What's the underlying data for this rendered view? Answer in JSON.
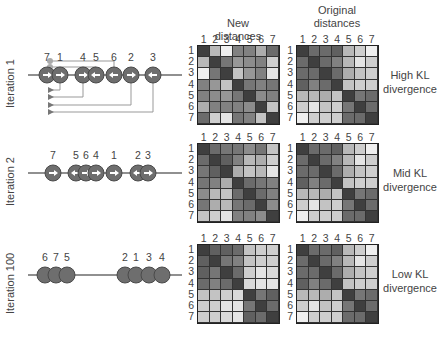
{
  "headers": {
    "new_distances": [
      "New",
      "distances"
    ],
    "original_distances": [
      "Original",
      "distances"
    ]
  },
  "axis_indices": [
    "1",
    "2",
    "3",
    "4",
    "5",
    "6",
    "7"
  ],
  "rows": [
    {
      "iteration_label": "Iteration 1",
      "kl_label": [
        "High KL",
        "divergence"
      ],
      "points": [
        {
          "label": "7",
          "x": 47,
          "dir": "right"
        },
        {
          "label": "1",
          "x": 60,
          "dir": "right"
        },
        {
          "label": "4",
          "x": 83,
          "dir": "right"
        },
        {
          "label": "5",
          "x": 96,
          "dir": "left"
        },
        {
          "label": "6",
          "x": 114,
          "dir": "left"
        },
        {
          "label": "2",
          "x": 131,
          "dir": "right"
        },
        {
          "label": "3",
          "x": 153,
          "dir": "left"
        }
      ],
      "new_matrix": [
        [
          15,
          70,
          95,
          45,
          45,
          65,
          35
        ],
        [
          70,
          15,
          40,
          55,
          50,
          45,
          80
        ],
        [
          95,
          40,
          15,
          75,
          55,
          45,
          90
        ],
        [
          45,
          55,
          75,
          15,
          40,
          45,
          40
        ],
        [
          45,
          50,
          55,
          40,
          15,
          50,
          45
        ],
        [
          65,
          45,
          45,
          45,
          50,
          15,
          75
        ],
        [
          35,
          80,
          90,
          40,
          45,
          75,
          15
        ]
      ],
      "original_matrix": [
        [
          15,
          35,
          35,
          30,
          70,
          80,
          95
        ],
        [
          35,
          15,
          35,
          45,
          70,
          90,
          80
        ],
        [
          35,
          35,
          15,
          35,
          65,
          75,
          80
        ],
        [
          30,
          45,
          35,
          15,
          75,
          80,
          80
        ],
        [
          70,
          70,
          65,
          75,
          15,
          40,
          35
        ],
        [
          80,
          90,
          75,
          80,
          40,
          15,
          35
        ],
        [
          95,
          80,
          80,
          80,
          35,
          35,
          15
        ]
      ]
    },
    {
      "iteration_label": "Iteration 2",
      "kl_label": [
        "Mid KL",
        "divergence"
      ],
      "points": [
        {
          "label": "7",
          "x": 53,
          "dir": "right"
        },
        {
          "label": "5",
          "x": 76,
          "dir": "left"
        },
        {
          "label": "6",
          "x": 86,
          "dir": "right"
        },
        {
          "label": "4",
          "x": 96,
          "dir": "right"
        },
        {
          "label": "1",
          "x": 114,
          "dir": "right"
        },
        {
          "label": "2",
          "x": 138,
          "dir": "left"
        },
        {
          "label": "3",
          "x": 148,
          "dir": "right"
        }
      ],
      "new_matrix": [
        [
          15,
          35,
          40,
          40,
          50,
          40,
          75
        ],
        [
          35,
          15,
          30,
          45,
          70,
          65,
          80
        ],
        [
          40,
          30,
          15,
          65,
          75,
          70,
          90
        ],
        [
          40,
          45,
          65,
          15,
          35,
          40,
          45
        ],
        [
          50,
          70,
          75,
          35,
          15,
          35,
          45
        ],
        [
          40,
          65,
          70,
          40,
          35,
          15,
          50
        ],
        [
          75,
          80,
          90,
          45,
          45,
          50,
          15
        ]
      ],
      "original_matrix": [
        [
          15,
          35,
          35,
          30,
          70,
          80,
          95
        ],
        [
          35,
          15,
          35,
          45,
          70,
          90,
          80
        ],
        [
          35,
          35,
          15,
          35,
          65,
          75,
          80
        ],
        [
          30,
          45,
          35,
          15,
          75,
          80,
          80
        ],
        [
          70,
          70,
          65,
          75,
          15,
          40,
          35
        ],
        [
          80,
          90,
          75,
          80,
          40,
          15,
          35
        ],
        [
          95,
          80,
          80,
          80,
          35,
          35,
          15
        ]
      ]
    },
    {
      "iteration_label": "Iteration 100",
      "kl_label": [
        "Low KL",
        "divergence"
      ],
      "points": [
        {
          "label": "6",
          "x": 45,
          "dir": "none"
        },
        {
          "label": "7",
          "x": 56,
          "dir": "none"
        },
        {
          "label": "5",
          "x": 67,
          "dir": "none"
        },
        {
          "label": "2",
          "x": 125,
          "dir": "none"
        },
        {
          "label": "1",
          "x": 136,
          "dir": "none"
        },
        {
          "label": "3",
          "x": 149,
          "dir": "none"
        },
        {
          "label": "4",
          "x": 162,
          "dir": "none"
        }
      ],
      "new_matrix": [
        [
          15,
          30,
          30,
          35,
          75,
          80,
          80
        ],
        [
          30,
          15,
          40,
          45,
          75,
          80,
          80
        ],
        [
          30,
          40,
          15,
          35,
          80,
          90,
          85
        ],
        [
          35,
          45,
          35,
          15,
          85,
          90,
          90
        ],
        [
          75,
          75,
          80,
          85,
          15,
          40,
          30
        ],
        [
          80,
          80,
          90,
          90,
          40,
          15,
          35
        ],
        [
          80,
          80,
          85,
          90,
          30,
          35,
          15
        ]
      ],
      "original_matrix": [
        [
          15,
          35,
          35,
          30,
          70,
          80,
          95
        ],
        [
          35,
          15,
          35,
          45,
          70,
          90,
          80
        ],
        [
          35,
          35,
          15,
          35,
          65,
          75,
          80
        ],
        [
          30,
          45,
          35,
          15,
          75,
          80,
          80
        ],
        [
          70,
          70,
          65,
          75,
          15,
          40,
          35
        ],
        [
          80,
          90,
          75,
          80,
          40,
          15,
          35
        ],
        [
          95,
          80,
          80,
          80,
          35,
          35,
          15
        ]
      ]
    }
  ],
  "iteration1_links": [
    {
      "from_x": 114,
      "marker": "dot",
      "y": 61
    },
    {
      "from_x": 96,
      "marker": "dot",
      "y": 67
    },
    {
      "from_x": 60,
      "marker": "arrow",
      "y": 90
    },
    {
      "from_x": 83,
      "marker": "arrow",
      "y": 97
    },
    {
      "from_x": 131,
      "marker": "arrow",
      "y": 105
    },
    {
      "from_x": 153,
      "marker": "arrow",
      "y": 112
    }
  ],
  "colors": {
    "ball_fill": "#6e6e6e",
    "ball_stroke": "#4a4a4a",
    "line": "#222222",
    "link": "#999999",
    "grid_border": "#222222"
  }
}
